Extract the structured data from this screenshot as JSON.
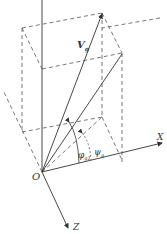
{
  "diagram": {
    "type": "3d-vector-decomposition",
    "colors": {
      "line": "#333333",
      "dashed": "#555555",
      "background": "#ffffff"
    },
    "labels": {
      "vector": "V",
      "vector_sub": "g",
      "origin": "O",
      "x_axis": "X",
      "z_axis": "Z",
      "angle_phi": "φ",
      "angle_phi_sub": "g1",
      "angle_psi": "ψ",
      "angle_psi_sub": "g"
    }
  }
}
